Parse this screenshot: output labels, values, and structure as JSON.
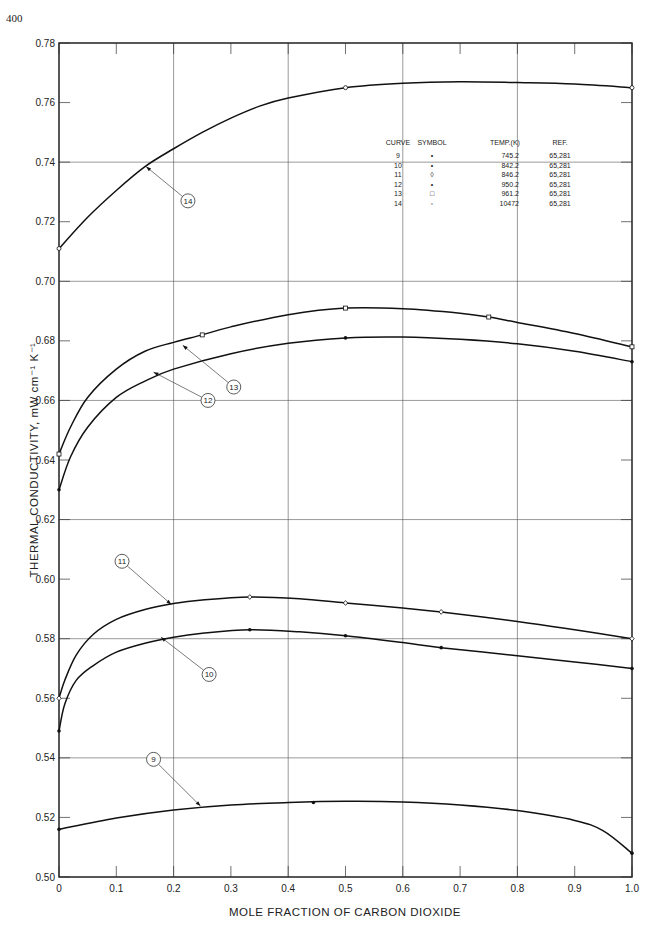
{
  "page_number": "400",
  "chart_data": {
    "type": "line",
    "title": "",
    "xlabel": "MOLE FRACTION OF CARBON DIOXIDE",
    "ylabel": "THERMAL CONDUCTIVITY, mW cm⁻¹ K⁻¹",
    "xlim": [
      0,
      1.0
    ],
    "ylim": [
      0.5,
      0.78
    ],
    "x_ticks": [
      "0",
      "0.1",
      "0.2",
      "0.3",
      "0.4",
      "0.5",
      "0.6",
      "0.7",
      "0.8",
      "0.9",
      "1.0"
    ],
    "y_ticks": [
      "0.50",
      "0.52",
      "0.54",
      "0.56",
      "0.58",
      "0.60",
      "0.62",
      "0.64",
      "0.66",
      "0.68",
      "0.70",
      "0.72",
      "0.74",
      "0.76",
      "0.78"
    ],
    "grid": {
      "x": [
        0.2,
        0.4,
        0.6,
        0.8
      ],
      "y": [
        0.54,
        0.58,
        0.62,
        0.66,
        0.7,
        0.74
      ]
    },
    "legend": {
      "position": "upper-right",
      "headers": [
        "CURVE",
        "SYMBOL",
        "TEMP.(K)",
        "REF."
      ],
      "rows": [
        {
          "curve": "9",
          "symbol": "•",
          "temp": "745.2",
          "ref": "65,281"
        },
        {
          "curve": "10",
          "symbol": "•",
          "temp": "842.2",
          "ref": "65,281"
        },
        {
          "curve": "11",
          "symbol": "◊",
          "temp": "846.2",
          "ref": "65,281"
        },
        {
          "curve": "12",
          "symbol": "•",
          "temp": "950.2",
          "ref": "65,281"
        },
        {
          "curve": "13",
          "symbol": "□",
          "temp": "961.2",
          "ref": "65,281"
        },
        {
          "curve": "14",
          "symbol": "◦",
          "temp": "10472",
          "ref": "65,281"
        }
      ]
    },
    "series": [
      {
        "name": "9",
        "temp_K": 745.2,
        "marker": "filled-dot",
        "x": [
          0,
          0.444,
          1.0
        ],
        "y": [
          0.516,
          0.525,
          0.508
        ],
        "curve_x": [
          0,
          0.1,
          0.2,
          0.3,
          0.4,
          0.5,
          0.6,
          0.7,
          0.8,
          0.9,
          0.95,
          1.0
        ],
        "curve_y": [
          0.516,
          0.5198,
          0.5225,
          0.5242,
          0.525,
          0.5254,
          0.5252,
          0.5242,
          0.5223,
          0.519,
          0.5155,
          0.508
        ]
      },
      {
        "name": "10",
        "temp_K": 842.2,
        "marker": "filled-dot",
        "x": [
          0,
          0.333,
          0.5,
          0.667,
          1.0
        ],
        "y": [
          0.549,
          0.583,
          0.581,
          0.577,
          0.57
        ],
        "curve_x": [
          0,
          0.01,
          0.03,
          0.06,
          0.1,
          0.15,
          0.2,
          0.25,
          0.333,
          0.42,
          0.5,
          0.6,
          0.667,
          0.8,
          0.9,
          1.0
        ],
        "curve_y": [
          0.549,
          0.558,
          0.566,
          0.571,
          0.5755,
          0.5785,
          0.5805,
          0.5818,
          0.583,
          0.5823,
          0.581,
          0.5787,
          0.577,
          0.5743,
          0.5722,
          0.57
        ]
      },
      {
        "name": "11",
        "temp_K": 846.2,
        "marker": "open-diamond",
        "x": [
          0,
          0.333,
          0.5,
          0.667,
          1.0
        ],
        "y": [
          0.56,
          0.594,
          0.592,
          0.589,
          0.58
        ],
        "curve_x": [
          0,
          0.01,
          0.03,
          0.06,
          0.1,
          0.15,
          0.2,
          0.25,
          0.333,
          0.42,
          0.5,
          0.6,
          0.667,
          0.8,
          0.9,
          1.0
        ],
        "curve_y": [
          0.56,
          0.566,
          0.5745,
          0.5815,
          0.5865,
          0.5898,
          0.5918,
          0.593,
          0.594,
          0.5934,
          0.592,
          0.5903,
          0.589,
          0.5858,
          0.583,
          0.58
        ]
      },
      {
        "name": "12",
        "temp_K": 950.2,
        "marker": "filled-dot",
        "x": [
          0,
          0.5,
          1.0
        ],
        "y": [
          0.63,
          0.681,
          0.673
        ],
        "curve_x": [
          0,
          0.02,
          0.05,
          0.1,
          0.15,
          0.2,
          0.3,
          0.4,
          0.5,
          0.6,
          0.7,
          0.8,
          0.9,
          1.0
        ],
        "curve_y": [
          0.63,
          0.641,
          0.651,
          0.661,
          0.6665,
          0.6705,
          0.6757,
          0.6792,
          0.681,
          0.6813,
          0.6805,
          0.679,
          0.6765,
          0.673
        ]
      },
      {
        "name": "13",
        "temp_K": 961.2,
        "marker": "open-square",
        "x": [
          0,
          0.25,
          0.5,
          0.75,
          1.0
        ],
        "y": [
          0.642,
          0.682,
          0.691,
          0.688,
          0.678
        ],
        "curve_x": [
          0,
          0.02,
          0.05,
          0.1,
          0.15,
          0.2,
          0.25,
          0.3,
          0.4,
          0.5,
          0.6,
          0.7,
          0.75,
          0.8,
          0.9,
          1.0
        ],
        "curve_y": [
          0.642,
          0.651,
          0.661,
          0.6705,
          0.6765,
          0.6795,
          0.682,
          0.6847,
          0.6888,
          0.691,
          0.6908,
          0.6893,
          0.688,
          0.6862,
          0.6825,
          0.678
        ]
      },
      {
        "name": "14",
        "temp_K": 1047.2,
        "marker": "open-circle",
        "x": [
          0,
          0.5,
          1.0
        ],
        "y": [
          0.711,
          0.765,
          0.765
        ],
        "curve_x": [
          0,
          0.05,
          0.1,
          0.15,
          0.2,
          0.25,
          0.3,
          0.35,
          0.4,
          0.5,
          0.6,
          0.7,
          0.8,
          0.9,
          1.0
        ],
        "curve_y": [
          0.711,
          0.7215,
          0.7305,
          0.7385,
          0.7445,
          0.75,
          0.7548,
          0.7588,
          0.7615,
          0.765,
          0.7665,
          0.767,
          0.7667,
          0.7662,
          0.765
        ]
      }
    ],
    "callouts": [
      {
        "label": "14",
        "pos": [
          0.225,
          0.727
        ],
        "target": [
          0.152,
          0.7385
        ]
      },
      {
        "label": "13",
        "pos": [
          0.305,
          0.6645
        ],
        "target": [
          0.216,
          0.6785
        ]
      },
      {
        "label": "12",
        "pos": [
          0.26,
          0.66
        ],
        "target": [
          0.165,
          0.6695
        ]
      },
      {
        "label": "11",
        "pos": [
          0.11,
          0.606
        ],
        "target": [
          0.196,
          0.5915
        ]
      },
      {
        "label": "10",
        "pos": [
          0.262,
          0.568
        ],
        "target": [
          0.178,
          0.5805
        ]
      },
      {
        "label": "9",
        "pos": [
          0.165,
          0.5395
        ],
        "target": [
          0.247,
          0.5238
        ]
      }
    ]
  }
}
